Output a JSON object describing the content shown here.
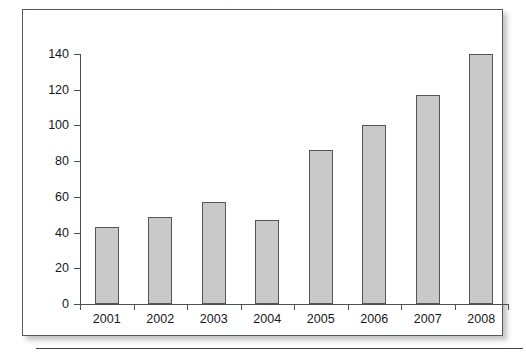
{
  "figure": {
    "top_artifact_text": "· ·  ·· ·  ·"
  },
  "chart_data": {
    "type": "bar",
    "title": "",
    "xlabel": "",
    "ylabel": "",
    "categories": [
      "2001",
      "2002",
      "2003",
      "2004",
      "2005",
      "2006",
      "2007",
      "2008"
    ],
    "values": [
      43,
      49,
      57,
      47,
      86,
      100,
      117,
      140
    ],
    "ylim": [
      0,
      140
    ],
    "yticks": [
      0,
      20,
      40,
      60,
      80,
      100,
      120,
      140
    ],
    "ytick_labels": [
      "0",
      "20",
      "40",
      "60",
      "80",
      "100",
      "120",
      "140"
    ],
    "grid": false,
    "legend": null,
    "bar_fill_color": "#c9c9c9",
    "bar_edge_color": "#53575b",
    "axis_color": "#4b4f53"
  }
}
